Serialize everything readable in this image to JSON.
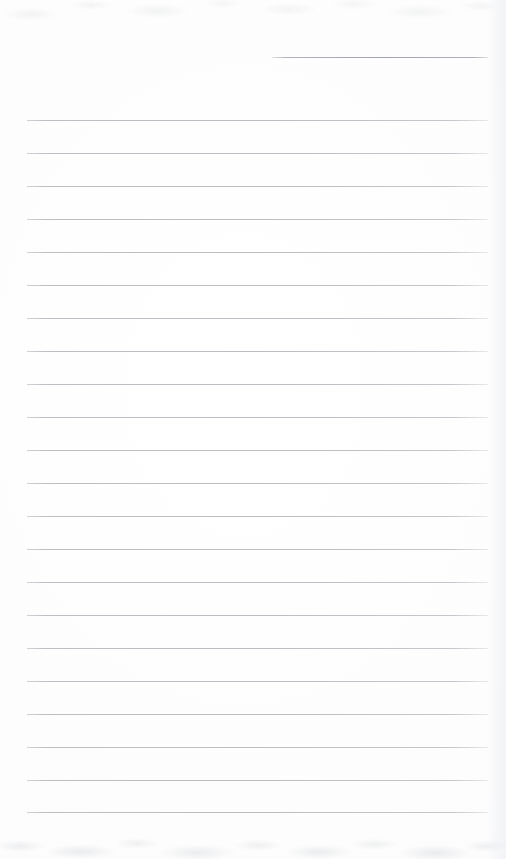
{
  "document": {
    "kind": "lined-paper-scan",
    "title": "Blank Ruled Notepad Page",
    "width": 506,
    "height": 859,
    "background_color": "#fdfdfd",
    "has_text": false,
    "has_handwriting": false,
    "rule_color": "#babec3",
    "rule_thickness_px": 1,
    "rule_spacing_px": 33,
    "left_margin_x": 27,
    "right_margin_x": 488,
    "rule_count_total": 23,
    "rule_count_full_width": 22,
    "rule_count_partial": 1
  },
  "rules": [
    {
      "id": "rule-00",
      "y": 57,
      "x1": 272,
      "x2": 488,
      "span": "partial"
    },
    {
      "id": "rule-01",
      "y": 120,
      "x1": 27,
      "x2": 488,
      "span": "full"
    },
    {
      "id": "rule-02",
      "y": 153,
      "x1": 27,
      "x2": 488,
      "span": "full"
    },
    {
      "id": "rule-03",
      "y": 186,
      "x1": 27,
      "x2": 488,
      "span": "full"
    },
    {
      "id": "rule-04",
      "y": 219,
      "x1": 27,
      "x2": 488,
      "span": "full"
    },
    {
      "id": "rule-05",
      "y": 252,
      "x1": 27,
      "x2": 488,
      "span": "full"
    },
    {
      "id": "rule-06",
      "y": 285,
      "x1": 27,
      "x2": 488,
      "span": "full"
    },
    {
      "id": "rule-07",
      "y": 318,
      "x1": 27,
      "x2": 488,
      "span": "full"
    },
    {
      "id": "rule-08",
      "y": 351,
      "x1": 27,
      "x2": 488,
      "span": "full"
    },
    {
      "id": "rule-09",
      "y": 384,
      "x1": 27,
      "x2": 488,
      "span": "full"
    },
    {
      "id": "rule-10",
      "y": 417,
      "x1": 27,
      "x2": 488,
      "span": "full"
    },
    {
      "id": "rule-11",
      "y": 450,
      "x1": 27,
      "x2": 488,
      "span": "full"
    },
    {
      "id": "rule-12",
      "y": 483,
      "x1": 27,
      "x2": 488,
      "span": "full"
    },
    {
      "id": "rule-13",
      "y": 516,
      "x1": 27,
      "x2": 488,
      "span": "full"
    },
    {
      "id": "rule-14",
      "y": 549,
      "x1": 27,
      "x2": 488,
      "span": "full"
    },
    {
      "id": "rule-15",
      "y": 582,
      "x1": 27,
      "x2": 488,
      "span": "full"
    },
    {
      "id": "rule-16",
      "y": 615,
      "x1": 27,
      "x2": 488,
      "span": "full"
    },
    {
      "id": "rule-17",
      "y": 648,
      "x1": 27,
      "x2": 488,
      "span": "full"
    },
    {
      "id": "rule-18",
      "y": 681,
      "x1": 27,
      "x2": 488,
      "span": "full"
    },
    {
      "id": "rule-19",
      "y": 714,
      "x1": 27,
      "x2": 488,
      "span": "full"
    },
    {
      "id": "rule-20",
      "y": 747,
      "x1": 27,
      "x2": 488,
      "span": "full"
    },
    {
      "id": "rule-21",
      "y": 780,
      "x1": 27,
      "x2": 488,
      "span": "full"
    },
    {
      "id": "rule-22",
      "y": 812,
      "x1": 27,
      "x2": 488,
      "span": "full"
    }
  ]
}
